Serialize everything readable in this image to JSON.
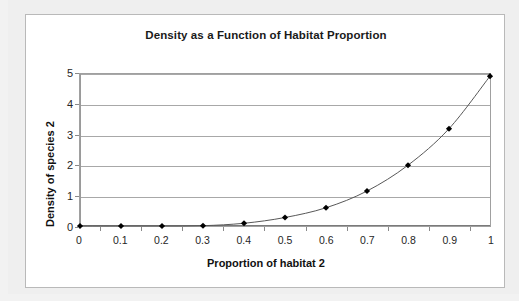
{
  "chart": {
    "title": "Density as a Function of Habitat Proportion",
    "x_axis_title": "Proportion of habitat 2",
    "y_axis_title": "Density of species 2"
  },
  "chart_data": {
    "type": "line",
    "title": "Density as a Function of Habitat Proportion",
    "xlabel": "Proportion of habitat 2",
    "ylabel": "Density of species 2",
    "xlim": [
      0,
      1
    ],
    "ylim": [
      0,
      5
    ],
    "grid": true,
    "legend": "none",
    "marker": "diamond",
    "marker_color": "#000000",
    "line_color": "#555555",
    "xticks": [
      "0",
      "0.1",
      "0.2",
      "0.3",
      "0.4",
      "0.5",
      "0.6",
      "0.7",
      "0.8",
      "0.9",
      "1"
    ],
    "yticks": [
      "0",
      "1",
      "2",
      "3",
      "4",
      "5"
    ],
    "x": [
      0,
      0.1,
      0.2,
      0.3,
      0.4,
      0.5,
      0.6,
      0.7,
      0.8,
      0.9,
      1
    ],
    "values": [
      0,
      0,
      0,
      0.01,
      0.09,
      0.28,
      0.6,
      1.15,
      2.0,
      3.2,
      4.93
    ]
  }
}
